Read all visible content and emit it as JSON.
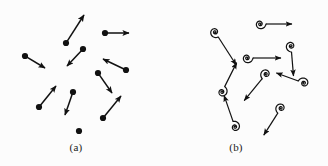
{
  "figure": {
    "background_color": "#fcfcfc",
    "ink_color": "#111111",
    "width": 328,
    "height": 166
  },
  "panels": [
    {
      "id": "a",
      "caption": "(a)",
      "caption_x": 76,
      "caption_y": 150,
      "glyph_type": "dot-arrow",
      "dot_radius": 3.1,
      "line_width": 1.5,
      "items": [
        {
          "name": "vector-1",
          "x": 66,
          "y": 43,
          "dx": 18,
          "dy": -28
        },
        {
          "name": "vector-2",
          "x": 105,
          "y": 33,
          "dx": 24,
          "dy": 0
        },
        {
          "name": "vector-3",
          "x": 25,
          "y": 56,
          "dx": 20,
          "dy": 12
        },
        {
          "name": "vector-4",
          "x": 83,
          "y": 49,
          "dx": -16,
          "dy": 17
        },
        {
          "name": "vector-5",
          "x": 126,
          "y": 70,
          "dx": -23,
          "dy": -11
        },
        {
          "name": "vector-6",
          "x": 98,
          "y": 73,
          "dx": 14,
          "dy": 20
        },
        {
          "name": "vector-7",
          "x": 39,
          "y": 107,
          "dx": 17,
          "dy": -21
        },
        {
          "name": "vector-8",
          "x": 73,
          "y": 92,
          "dx": -8,
          "dy": 23
        },
        {
          "name": "vector-9",
          "x": 103,
          "y": 118,
          "dx": 18,
          "dy": -22
        },
        {
          "name": "vector-10",
          "x": 79,
          "y": 131,
          "dx": 0,
          "dy": 0
        }
      ]
    },
    {
      "id": "b",
      "caption": "(b)",
      "caption_x": 236,
      "caption_y": 150,
      "glyph_type": "spiral-arrow",
      "spiral_radius": 6.0,
      "line_width": 1.2,
      "items": [
        {
          "name": "spiral-1",
          "x": 215,
          "y": 32,
          "dx": 18,
          "dy": 28
        },
        {
          "name": "spiral-2",
          "x": 260,
          "y": 24,
          "dx": 26,
          "dy": 0
        },
        {
          "name": "spiral-3",
          "x": 291,
          "y": 46,
          "dx": 2,
          "dy": 24
        },
        {
          "name": "spiral-4",
          "x": 247,
          "y": 58,
          "dx": 28,
          "dy": 0
        },
        {
          "name": "spiral-5",
          "x": 266,
          "y": 74,
          "dx": -18,
          "dy": 22
        },
        {
          "name": "spiral-6",
          "x": 304,
          "y": 83,
          "dx": -22,
          "dy": -8
        },
        {
          "name": "spiral-7",
          "x": 222,
          "y": 92,
          "dx": 12,
          "dy": -24
        },
        {
          "name": "spiral-8",
          "x": 235,
          "y": 127,
          "dx": -9,
          "dy": -26
        },
        {
          "name": "spiral-9",
          "x": 281,
          "y": 108,
          "dx": -14,
          "dy": 22
        }
      ]
    }
  ]
}
